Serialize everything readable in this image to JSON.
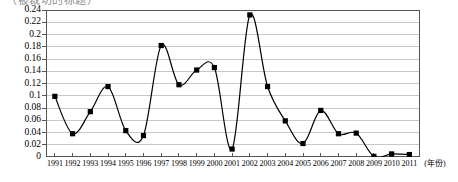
{
  "title": {
    "clipped_text": "（被裁切的标题）"
  },
  "chart_data": {
    "type": "line",
    "title": "",
    "xlabel": "(年份)",
    "ylabel": "",
    "grid": true,
    "legend": false,
    "xlim": [
      1990.5,
      2011.6
    ],
    "ylim": [
      0,
      0.24
    ],
    "ytick_labels": [
      "0.24",
      "0.22",
      "0.2",
      "0.18",
      "0.16",
      "0.14",
      "0.12",
      "0.1",
      "0.08",
      "0.06",
      "0.04",
      "0.02",
      "0"
    ],
    "ytick_values": [
      0.24,
      0.22,
      0.2,
      0.18,
      0.16,
      0.14,
      0.12,
      0.1,
      0.08,
      0.06,
      0.04,
      0.02,
      0
    ],
    "categories": [
      "1991",
      "1992",
      "1993",
      "1994",
      "1995",
      "1996",
      "1997",
      "1998",
      "1999",
      "2000",
      "2001",
      "2002",
      "2003",
      "2004",
      "2005",
      "2006",
      "2007",
      "2008",
      "2009",
      "2010",
      "2011"
    ],
    "x": [
      1991,
      1992,
      1993,
      1994,
      1995,
      1996,
      1997,
      1998,
      1999,
      2000,
      2001,
      2002,
      2003,
      2004,
      2005,
      2006,
      2007,
      2008,
      2009,
      2010,
      2011
    ],
    "values": [
      0.099,
      0.038,
      0.074,
      0.115,
      0.043,
      0.035,
      0.182,
      0.118,
      0.142,
      0.146,
      0.013,
      0.232,
      0.115,
      0.059,
      0.022,
      0.076,
      0.038,
      0.039,
      0.001,
      0.005,
      0.004
    ],
    "series": [
      {
        "name": "",
        "values": [
          0.099,
          0.038,
          0.074,
          0.115,
          0.043,
          0.035,
          0.182,
          0.118,
          0.142,
          0.146,
          0.013,
          0.232,
          0.115,
          0.059,
          0.022,
          0.076,
          0.038,
          0.039,
          0.001,
          0.005,
          0.004
        ]
      }
    ],
    "line_color": "#000000",
    "marker_color": "#000000",
    "marker": "square",
    "grid_color": "#c8c8c8",
    "axis_color": "#555555"
  }
}
